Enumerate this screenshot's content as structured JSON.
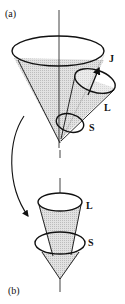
{
  "diagram": {
    "panel_a": {
      "label": "(a)",
      "vectors": {
        "total": "J",
        "orbital": "L",
        "spin": "S"
      }
    },
    "panel_b": {
      "label": "(b)",
      "vectors": {
        "orbital": "L",
        "spin": "S"
      }
    },
    "colors": {
      "stroke": "#111111",
      "cone_fill": "#d4d4d4",
      "background": "#ffffff"
    }
  }
}
